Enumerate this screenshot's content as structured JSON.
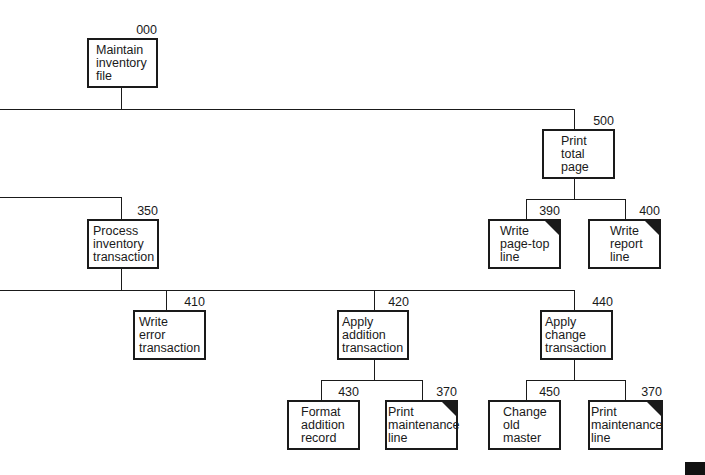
{
  "diagram": {
    "type": "structure-chart",
    "modules": [
      {
        "id": "000",
        "lines": [
          "Maintain",
          "inventory",
          "file"
        ],
        "common": false
      },
      {
        "id": "500",
        "lines": [
          "Print",
          "total",
          "page"
        ],
        "common": false
      },
      {
        "id": "390",
        "lines": [
          "Write",
          "page-top",
          "line"
        ],
        "common": true
      },
      {
        "id": "400",
        "lines": [
          "Write",
          "report",
          "line"
        ],
        "common": true
      },
      {
        "id": "350",
        "lines": [
          "Process",
          "inventory",
          "transaction"
        ],
        "common": false
      },
      {
        "id": "410",
        "lines": [
          "Write",
          "error",
          "transaction"
        ],
        "common": false
      },
      {
        "id": "420",
        "lines": [
          "Apply",
          "addition",
          "transaction"
        ],
        "common": false
      },
      {
        "id": "440",
        "lines": [
          "Apply",
          "change",
          "transaction"
        ],
        "common": false
      },
      {
        "id": "430",
        "lines": [
          "Format",
          "addition",
          "record"
        ],
        "common": false
      },
      {
        "id": "370",
        "lines": [
          "Print",
          "maintenance",
          "line"
        ],
        "common": true
      },
      {
        "id": "450",
        "lines": [
          "Change",
          "old",
          "master"
        ],
        "common": false
      },
      {
        "id": "370",
        "lines": [
          "Print",
          "maintenance",
          "line"
        ],
        "common": true
      }
    ],
    "edges": [
      [
        "000",
        "500"
      ],
      [
        "000",
        "350"
      ],
      [
        "500",
        "390"
      ],
      [
        "500",
        "400"
      ],
      [
        "350",
        "410"
      ],
      [
        "350",
        "420"
      ],
      [
        "350",
        "440"
      ],
      [
        "420",
        "430"
      ],
      [
        "420",
        "370"
      ],
      [
        "440",
        "450"
      ],
      [
        "440",
        "370"
      ]
    ]
  }
}
